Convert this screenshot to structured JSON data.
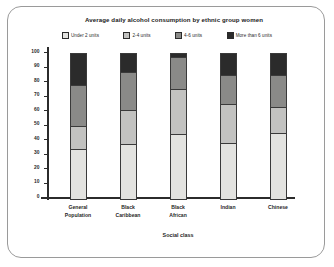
{
  "chart_data": {
    "type": "bar",
    "subtype": "stacked-bar-100",
    "title": "Average daily alcohol consumption by ethnic group women",
    "xlabel": "Social class",
    "ylabel": "Percentage",
    "ylim": [
      0,
      100
    ],
    "ytick_step": 10,
    "yticks": [
      100,
      90,
      80,
      70,
      60,
      50,
      40,
      30,
      20,
      10,
      0
    ],
    "ytick_labels": [
      "100",
      "90",
      "80",
      "70",
      "60",
      "50",
      "40",
      "30",
      "20",
      "10",
      "0"
    ],
    "grid": false,
    "legend_position": "top",
    "categories": [
      "General Population",
      "Black Caribbean",
      "Black African",
      "Indian",
      "Chinese"
    ],
    "category_lines": [
      [
        "General",
        "Population"
      ],
      [
        "Black",
        "Caribbean"
      ],
      [
        "Black",
        "African"
      ],
      [
        "Indian"
      ],
      [
        "Chinese"
      ]
    ],
    "series": [
      {
        "name": "Under 2 units",
        "color": "#e3e3e0",
        "values": [
          34,
          37,
          44,
          38,
          45
        ]
      },
      {
        "name": "2-4 units",
        "color": "#c2c2c0",
        "values": [
          16,
          24,
          31,
          27,
          18
        ]
      },
      {
        "name": "4-6 units",
        "color": "#8a8a88",
        "values": [
          28,
          26,
          22,
          20,
          22
        ]
      },
      {
        "name": "More than 6 units",
        "color": "#2b2b2b",
        "values": [
          22,
          13,
          3,
          15,
          15
        ]
      }
    ]
  },
  "legend": {
    "items": [
      {
        "label": "Under 2 units",
        "color": "#e3e3e0"
      },
      {
        "label": "2-4 units",
        "color": "#c2c2c0"
      },
      {
        "label": "4-6 units",
        "color": "#8a8a88"
      },
      {
        "label": "More than 6 units",
        "color": "#2b2b2b"
      }
    ]
  },
  "style": {
    "frame_border": "#9a9a9a",
    "axis_color": "#2b2b2b",
    "background": "#ffffff"
  }
}
